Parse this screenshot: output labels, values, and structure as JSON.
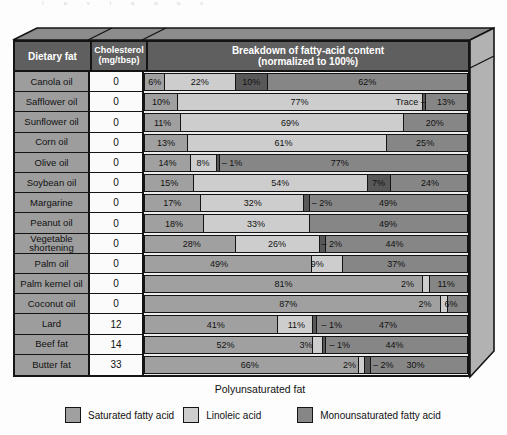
{
  "artifact_text": "( p y )  g  g  p  y",
  "table": {
    "headers": {
      "dietary_fat": "Dietary fat",
      "cholesterol_line1": "Cholesterol",
      "cholesterol_line2": "(mg/tbsp)",
      "breakdown_line1": "Breakdown of fatty-acid content",
      "breakdown_line2": "(normalized to 100%)"
    },
    "rows": [
      {
        "name": "Canola oil",
        "cholesterol": "0",
        "segments": [
          {
            "w": 6,
            "c": "sat"
          },
          {
            "w": 22,
            "c": "lin"
          },
          {
            "w": 10,
            "c": "poly"
          },
          {
            "w": 62,
            "c": "mono"
          }
        ],
        "labels": [
          {
            "t": "6%",
            "x": 3
          },
          {
            "t": "22%",
            "x": 17
          },
          {
            "t": "10%",
            "x": 33
          },
          {
            "t": "62%",
            "x": 69
          }
        ]
      },
      {
        "name": "Safflower oil",
        "cholesterol": "0",
        "segments": [
          {
            "w": 10,
            "c": "sat"
          },
          {
            "w": 76,
            "c": "lin"
          },
          {
            "w": 1,
            "c": "poly"
          },
          {
            "w": 13,
            "c": "mono"
          }
        ],
        "labels": [
          {
            "t": "10%",
            "x": 5
          },
          {
            "t": "77%",
            "x": 48
          },
          {
            "t": "Trace –",
            "x": 82.5
          },
          {
            "t": "13%",
            "x": 93.5
          }
        ]
      },
      {
        "name": "Sunflower oil",
        "cholesterol": "0",
        "segments": [
          {
            "w": 11,
            "c": "sat"
          },
          {
            "w": 69,
            "c": "lin"
          },
          {
            "w": 20,
            "c": "mono"
          }
        ],
        "labels": [
          {
            "t": "11%",
            "x": 5.5
          },
          {
            "t": "69%",
            "x": 45
          },
          {
            "t": "20%",
            "x": 90
          }
        ]
      },
      {
        "name": "Corn oil",
        "cholesterol": "0",
        "segments": [
          {
            "w": 13,
            "c": "sat"
          },
          {
            "w": 62,
            "c": "lin"
          },
          {
            "w": 25,
            "c": "mono"
          }
        ],
        "labels": [
          {
            "t": "13%",
            "x": 6.5
          },
          {
            "t": "61%",
            "x": 43
          },
          {
            "t": "25%",
            "x": 87
          }
        ]
      },
      {
        "name": "Olive oil",
        "cholesterol": "0",
        "segments": [
          {
            "w": 14,
            "c": "sat"
          },
          {
            "w": 8,
            "c": "lin"
          },
          {
            "w": 1,
            "c": "poly"
          },
          {
            "w": 77,
            "c": "mono"
          }
        ],
        "labels": [
          {
            "t": "14%",
            "x": 7
          },
          {
            "t": "8%",
            "x": 18
          },
          {
            "t": "– 1%",
            "x": 27
          },
          {
            "t": "77%",
            "x": 60.5
          }
        ]
      },
      {
        "name": "Soybean oil",
        "cholesterol": "0",
        "segments": [
          {
            "w": 15,
            "c": "sat"
          },
          {
            "w": 54,
            "c": "lin"
          },
          {
            "w": 7,
            "c": "poly"
          },
          {
            "w": 24,
            "c": "mono"
          }
        ],
        "labels": [
          {
            "t": "15%",
            "x": 7.5
          },
          {
            "t": "54%",
            "x": 42
          },
          {
            "t": "7%",
            "x": 72.5
          },
          {
            "t": "24%",
            "x": 88.5
          }
        ]
      },
      {
        "name": "Margarine",
        "cholesterol": "0",
        "segments": [
          {
            "w": 17,
            "c": "sat"
          },
          {
            "w": 32,
            "c": "lin"
          },
          {
            "w": 2,
            "c": "poly"
          },
          {
            "w": 49,
            "c": "mono"
          }
        ],
        "labels": [
          {
            "t": "17%",
            "x": 8.5
          },
          {
            "t": "32%",
            "x": 33.5
          },
          {
            "t": "– 2%",
            "x": 55
          },
          {
            "t": "49%",
            "x": 75.5
          }
        ]
      },
      {
        "name": "Peanut oil",
        "cholesterol": "0",
        "segments": [
          {
            "w": 18,
            "c": "sat"
          },
          {
            "w": 33,
            "c": "lin"
          },
          {
            "w": 49,
            "c": "mono"
          }
        ],
        "labels": [
          {
            "t": "18%",
            "x": 9
          },
          {
            "t": "33%",
            "x": 34.5
          },
          {
            "t": "49%",
            "x": 75.5
          }
        ]
      },
      {
        "name": "Vegetable shortening",
        "cholesterol": "0",
        "segments": [
          {
            "w": 28,
            "c": "sat"
          },
          {
            "w": 26,
            "c": "lin"
          },
          {
            "w": 2,
            "c": "poly"
          },
          {
            "w": 44,
            "c": "mono"
          }
        ],
        "labels": [
          {
            "t": "28%",
            "x": 14.5
          },
          {
            "t": "26%",
            "x": 41
          },
          {
            "t": "– 2%",
            "x": 58
          },
          {
            "t": "44%",
            "x": 77.5
          }
        ]
      },
      {
        "name": "Palm oil",
        "cholesterol": "0",
        "segments": [
          {
            "w": 49,
            "c": "sat"
          },
          {
            "w": 9,
            "c": "lin"
          },
          {
            "w": 37,
            "c": "mono"
          }
        ],
        "labels": [
          {
            "t": "49%",
            "x": 23
          },
          {
            "t": "9%",
            "x": 53.5
          },
          {
            "t": "37%",
            "x": 78
          }
        ]
      },
      {
        "name": "Palm kernel oil",
        "cholesterol": "0",
        "segments": [
          {
            "w": 81,
            "c": "sat"
          },
          {
            "w": 2,
            "c": "lin"
          },
          {
            "w": 11,
            "c": "mono"
          }
        ],
        "labels": [
          {
            "t": "81%",
            "x": 43
          },
          {
            "t": "2%",
            "x": 81.5
          },
          {
            "t": "11%",
            "x": 93.5
          }
        ]
      },
      {
        "name": "Coconut oil",
        "cholesterol": "0",
        "segments": [
          {
            "w": 87,
            "c": "sat"
          },
          {
            "w": 2,
            "c": "lin"
          },
          {
            "w": 6,
            "c": "mono"
          }
        ],
        "labels": [
          {
            "t": "87%",
            "x": 44.5
          },
          {
            "t": "2%",
            "x": 87
          },
          {
            "t": "6%",
            "x": 95
          }
        ]
      },
      {
        "name": "Lard",
        "cholesterol": "12",
        "segments": [
          {
            "w": 41,
            "c": "sat"
          },
          {
            "w": 11,
            "c": "lin"
          },
          {
            "w": 1,
            "c": "poly"
          },
          {
            "w": 47,
            "c": "mono"
          }
        ],
        "labels": [
          {
            "t": "41%",
            "x": 22
          },
          {
            "t": "11%",
            "x": 47
          },
          {
            "t": "– 1%",
            "x": 58
          },
          {
            "t": "47%",
            "x": 75.5
          }
        ]
      },
      {
        "name": "Beef fat",
        "cholesterol": "14",
        "segments": [
          {
            "w": 52,
            "c": "sat"
          },
          {
            "w": 3,
            "c": "lin"
          },
          {
            "w": 1,
            "c": "poly"
          },
          {
            "w": 44,
            "c": "mono"
          }
        ],
        "labels": [
          {
            "t": "52%",
            "x": 25
          },
          {
            "t": "3%",
            "x": 50
          },
          {
            "t": "– 1%",
            "x": 60.5
          },
          {
            "t": "44%",
            "x": 77.5
          }
        ]
      },
      {
        "name": "Butter fat",
        "cholesterol": "33",
        "segments": [
          {
            "w": 66,
            "c": "sat"
          },
          {
            "w": 2,
            "c": "lin"
          },
          {
            "w": 2,
            "c": "poly"
          },
          {
            "w": 30,
            "c": "mono"
          }
        ],
        "labels": [
          {
            "t": "66%",
            "x": 32.5
          },
          {
            "t": "2%",
            "x": 63.5
          },
          {
            "t": "– 2%",
            "x": 74
          },
          {
            "t": "30%",
            "x": 84
          }
        ]
      }
    ]
  },
  "footer": {
    "polyunsaturated_label": "Polyunsaturated fat"
  },
  "legend": [
    {
      "label": "Saturated fatty acid",
      "color": "#a0a0a0",
      "gap_after": 9
    },
    {
      "label": "Linoleic acid",
      "color": "#cdcdcd",
      "gap_after": 36
    },
    {
      "label": "Monounsaturated fatty acid",
      "color": "#868686",
      "gap_after": 0
    }
  ],
  "colors": {
    "sat": "#a0a0a0",
    "lin": "#cdcdcd",
    "poly": "#585858",
    "mono": "#868686",
    "header_bg": "#5f5f5f",
    "row_label_bg": "#9d9d9d",
    "value_cell_bg": "#fbfbfb",
    "border": "#141414",
    "top_face": "#8c8c8c",
    "right_face": "#b2b2b2"
  },
  "chart_data": {
    "type": "bar",
    "stacked": true,
    "normalized_to": 100,
    "title": "Breakdown of fatty-acid content (normalized to 100%)",
    "categories": [
      "Canola oil",
      "Safflower oil",
      "Sunflower oil",
      "Corn oil",
      "Olive oil",
      "Soybean oil",
      "Margarine",
      "Peanut oil",
      "Vegetable shortening",
      "Palm oil",
      "Palm kernel oil",
      "Coconut oil",
      "Lard",
      "Beef fat",
      "Butter fat"
    ],
    "series": [
      {
        "name": "Saturated fatty acid",
        "values": [
          6,
          10,
          11,
          13,
          14,
          15,
          17,
          18,
          28,
          49,
          81,
          87,
          41,
          52,
          66
        ]
      },
      {
        "name": "Linoleic acid",
        "values": [
          22,
          77,
          69,
          61,
          8,
          54,
          32,
          33,
          26,
          9,
          2,
          2,
          11,
          3,
          2
        ]
      },
      {
        "name": "Polyunsaturated fat",
        "values": [
          10,
          "Trace",
          0,
          0,
          1,
          7,
          2,
          0,
          2,
          0,
          0,
          0,
          1,
          1,
          2
        ]
      },
      {
        "name": "Monounsaturated fatty acid",
        "values": [
          62,
          13,
          20,
          25,
          77,
          24,
          49,
          49,
          44,
          37,
          11,
          6,
          47,
          44,
          30
        ]
      }
    ],
    "extra_column": {
      "header": "Cholesterol (mg/tbsp)",
      "values": [
        0,
        0,
        0,
        0,
        0,
        0,
        0,
        0,
        0,
        0,
        0,
        0,
        12,
        14,
        33
      ]
    },
    "legend_position": "bottom",
    "legend_entries": [
      "Saturated fatty acid",
      "Linoleic acid",
      "Monounsaturated fatty acid"
    ],
    "annotation": "Polyunsaturated fat"
  }
}
